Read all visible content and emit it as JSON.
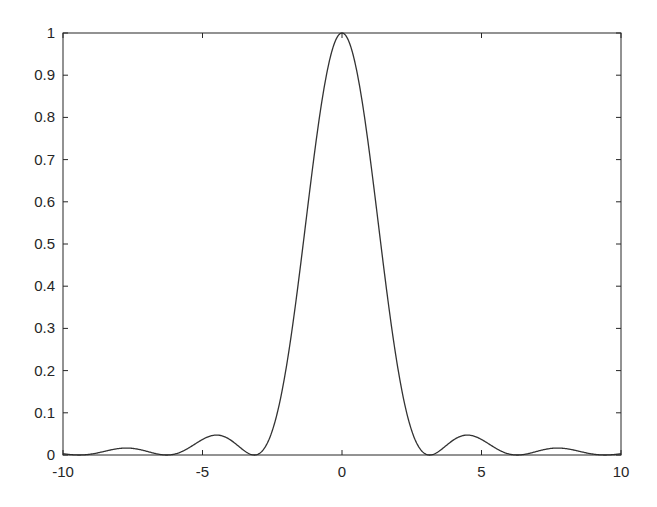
{
  "chart_data": {
    "type": "line",
    "title": "",
    "xlabel": "",
    "ylabel": "",
    "xlim": [
      -10,
      10
    ],
    "ylim": [
      0,
      1
    ],
    "grid": false,
    "legend": null,
    "x_ticks": [
      -10,
      -5,
      0,
      5,
      10
    ],
    "x_tick_labels": [
      "-10",
      "-5",
      "0",
      "5",
      "10"
    ],
    "y_ticks": [
      0,
      0.1,
      0.2,
      0.3,
      0.4,
      0.5,
      0.6,
      0.7,
      0.8,
      0.9,
      1
    ],
    "y_tick_labels": [
      "0",
      "0.1",
      "0.2",
      "0.3",
      "0.4",
      "0.5",
      "0.6",
      "0.7",
      "0.8",
      "0.9",
      "1"
    ],
    "series": [
      {
        "name": "sinc^2(x) = (sin(x)/x)^2",
        "color": "#333333",
        "x": [
          -10,
          -9,
          -8,
          -7.725,
          -7,
          -6.283,
          -6,
          -5,
          -4.493,
          -4,
          -3.5,
          -3.1416,
          -3,
          -2.5,
          -2,
          -1.5,
          -1,
          -0.5,
          0,
          0.5,
          1,
          1.5,
          2,
          2.5,
          3,
          3.1416,
          3.5,
          4,
          4.493,
          5,
          6,
          6.283,
          7,
          7.725,
          8,
          9,
          10
        ],
        "y": [
          0.003,
          0.002,
          0.015,
          0.016,
          0.009,
          0.0,
          0.002,
          0.037,
          0.047,
          0.036,
          0.01,
          0.0,
          0.002,
          0.057,
          0.207,
          0.442,
          0.708,
          0.919,
          1.0,
          0.919,
          0.708,
          0.442,
          0.207,
          0.057,
          0.002,
          0.0,
          0.01,
          0.036,
          0.047,
          0.037,
          0.002,
          0.0,
          0.009,
          0.016,
          0.015,
          0.002,
          0.003
        ]
      }
    ]
  },
  "plot": {
    "axis_color": "#262626",
    "line_color": "#333333",
    "background": "#ffffff"
  }
}
